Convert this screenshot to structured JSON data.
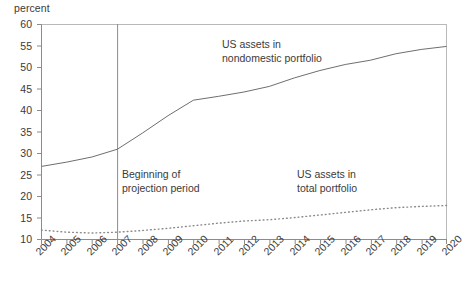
{
  "chart_data": {
    "type": "line",
    "title": "",
    "xlabel": "",
    "ylabel": "percent",
    "ylim": [
      10,
      60
    ],
    "xlim": [
      2004,
      2020
    ],
    "grid": false,
    "legend_position": "inline-annotations",
    "yticks": [
      10,
      15,
      20,
      25,
      30,
      35,
      40,
      45,
      50,
      55,
      60
    ],
    "categories": [
      2004,
      2005,
      2006,
      2007,
      2008,
      2009,
      2010,
      2011,
      2012,
      2013,
      2014,
      2015,
      2016,
      2017,
      2018,
      2019,
      2020
    ],
    "series": [
      {
        "name": "US assets in nondomestic portfolio",
        "style": "solid",
        "values": [
          27.0,
          28.0,
          29.2,
          31.0,
          34.8,
          38.8,
          42.4,
          43.3,
          44.3,
          45.6,
          47.6,
          49.3,
          50.7,
          51.7,
          53.2,
          54.2,
          54.9
        ]
      },
      {
        "name": "US assets in total portfolio",
        "style": "dotted",
        "values": [
          12.2,
          11.7,
          11.5,
          11.7,
          12.1,
          12.6,
          13.2,
          13.8,
          14.3,
          14.6,
          15.1,
          15.7,
          16.3,
          16.9,
          17.4,
          17.7,
          17.9
        ]
      }
    ],
    "annotations": [
      {
        "id": "nondomestic-label",
        "line1": "US assets in",
        "line2": "nondomestic portfolio"
      },
      {
        "id": "projection-label",
        "line1": "Beginning of",
        "line2": "projection period"
      },
      {
        "id": "total-portfolio-label",
        "line1": "US assets in",
        "line2": "total portfolio"
      }
    ],
    "marker_line": {
      "name": "projection-start",
      "x": 2007
    },
    "colors": {
      "axis": "#8c8c8c",
      "series_solid": "#6e6e6e",
      "series_dotted": "#8a8a8a",
      "text": "#3a3a3a",
      "marker_line": "#8c8c8c"
    }
  },
  "yticks": {
    "t0": "60",
    "t1": "55",
    "t2": "50",
    "t3": "45",
    "t4": "40",
    "t5": "35",
    "t6": "30",
    "t7": "25",
    "t8": "20",
    "t9": "15",
    "t10": "10"
  },
  "xticks": {
    "t0": "2004",
    "t1": "2005",
    "t2": "2006",
    "t3": "2007",
    "t4": "2008",
    "t5": "2009",
    "t6": "2010",
    "t7": "2011",
    "t8": "2012",
    "t9": "2013",
    "t10": "2014",
    "t11": "2015",
    "t12": "2016",
    "t13": "2017",
    "t14": "2018",
    "t15": "2019",
    "t16": "2020"
  },
  "labels": {
    "unit": "percent",
    "ann1_l1": "US assets in",
    "ann1_l2": "nondomestic portfolio",
    "ann2_l1": "Beginning of",
    "ann2_l2": "projection period",
    "ann3_l1": "US assets in",
    "ann3_l2": "total portfolio"
  }
}
